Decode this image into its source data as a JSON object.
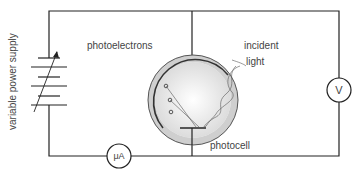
{
  "diagram": {
    "labels": {
      "power_supply": "variable power supply",
      "photoelectrons": "photoelectrons",
      "incident_light_1": "incident",
      "incident_light_2": "light",
      "photocell": "photocell",
      "voltmeter": "V",
      "microammeter": "μA"
    },
    "components": [
      "variable power supply",
      "photocell",
      "voltmeter",
      "microammeter"
    ],
    "colors": {
      "wire": "#222222",
      "photocell_fill": "#cfcfcf",
      "photocell_inner": "#f4f4f4",
      "text": "#444444"
    }
  }
}
